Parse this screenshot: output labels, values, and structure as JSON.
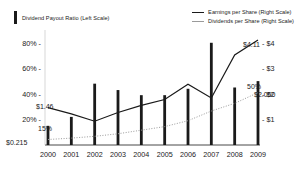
{
  "legend": {
    "left": {
      "label": "Dividend Payout Ratio (Left Scale)",
      "color": "#1a1a1a",
      "marker": "bar-swatch"
    },
    "right": [
      {
        "label": "Earnings per Share (Right Scale)",
        "color": "#1a1a1a",
        "marker": "solid-line"
      },
      {
        "label": "Dividends per Share (Right Scale)",
        "color": "#9a9a9a",
        "marker": "dotted-line"
      }
    ]
  },
  "axes": {
    "left_ticks": [
      "20%",
      "40%",
      "60%",
      "80%"
    ],
    "left_values": [
      20,
      40,
      60,
      80
    ],
    "right_ticks": [
      "$1",
      "$2",
      "$3",
      "$4"
    ],
    "right_values": [
      1,
      2,
      3,
      4
    ],
    "x_ticks": [
      "2000",
      "2001",
      "2002",
      "2003",
      "2004",
      "2005",
      "2006",
      "2007",
      "2008",
      "2009"
    ]
  },
  "annotations": [
    {
      "name": "eps-start-label",
      "text": "$1.46",
      "x": 36,
      "y": 103
    },
    {
      "name": "payout-start-label",
      "text": "15%",
      "x": 38,
      "y": 125
    },
    {
      "name": "dps-start-label",
      "text": "$0.215",
      "x": 6,
      "y": 139
    },
    {
      "name": "eps-end-label",
      "text": "$4.11",
      "x": 243,
      "y": 41
    },
    {
      "name": "payout-end-label",
      "text": "50%",
      "x": 247,
      "y": 83
    },
    {
      "name": "dps-end-label",
      "text": "$2.050",
      "x": 254,
      "y": 91
    }
  ],
  "chart_data": {
    "type": "bar",
    "title": "",
    "xlabel": "",
    "ylabel": "",
    "categories": [
      "2000",
      "2001",
      "2002",
      "2003",
      "2004",
      "2005",
      "2006",
      "2007",
      "2008",
      "2009"
    ],
    "grid": false,
    "legend_position": "top",
    "left_axis": {
      "label": "Dividend Payout Ratio (Left Scale)",
      "ylim": [
        0,
        90
      ],
      "ticks": [
        20,
        40,
        60,
        80
      ],
      "tick_labels": [
        "20%",
        "40%",
        "60%",
        "80%"
      ],
      "unit": "percent"
    },
    "right_axis": {
      "label": "Earnings / Dividends per Share (Right Scale)",
      "ylim": [
        0,
        4.5
      ],
      "ticks": [
        1,
        2,
        3,
        4
      ],
      "tick_labels": [
        "$1",
        "$2",
        "$3",
        "$4"
      ],
      "unit": "dollars"
    },
    "series": [
      {
        "name": "Dividend Payout Ratio (Left Scale)",
        "type": "bar",
        "axis": "left",
        "unit": "percent",
        "color": "#1a1a1a",
        "values": [
          15,
          22,
          48,
          43,
          39,
          39,
          44,
          80,
          45,
          50
        ]
      },
      {
        "name": "Earnings per Share (Right Scale)",
        "type": "line",
        "axis": "right",
        "unit": "dollars",
        "color": "#1a1a1a",
        "style": "solid",
        "values": [
          1.46,
          1.22,
          0.93,
          1.27,
          1.55,
          1.78,
          2.38,
          1.84,
          3.52,
          4.11
        ]
      },
      {
        "name": "Dividends per Share (Right Scale)",
        "type": "line",
        "axis": "right",
        "unit": "dollars",
        "color": "#9a9a9a",
        "style": "dotted",
        "values": [
          0.215,
          0.27,
          0.34,
          0.44,
          0.58,
          0.72,
          0.95,
          1.33,
          1.63,
          2.05
        ]
      }
    ]
  }
}
